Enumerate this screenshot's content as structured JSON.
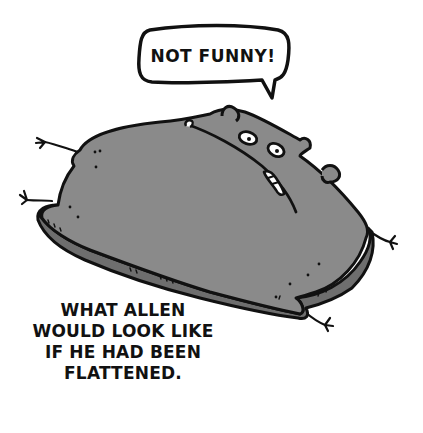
{
  "speech_bubble": {
    "text": "NOT FUNNY!"
  },
  "caption": {
    "lines": [
      "WHAT ALLEN",
      "WOULD LOOK LIKE",
      "IF HE HAD BEEN",
      "FLATTENED."
    ]
  },
  "colors": {
    "background": "#ffffff",
    "ink": "#111111",
    "body_fill": "#8a8a8a",
    "rim_fill": "#6e6e6e"
  },
  "illustration": {
    "subject": "flattened-hamster-character",
    "elements": [
      "speech-bubble",
      "flattened-body",
      "head",
      "eyes",
      "teeth",
      "ears",
      "paws",
      "caption"
    ]
  }
}
